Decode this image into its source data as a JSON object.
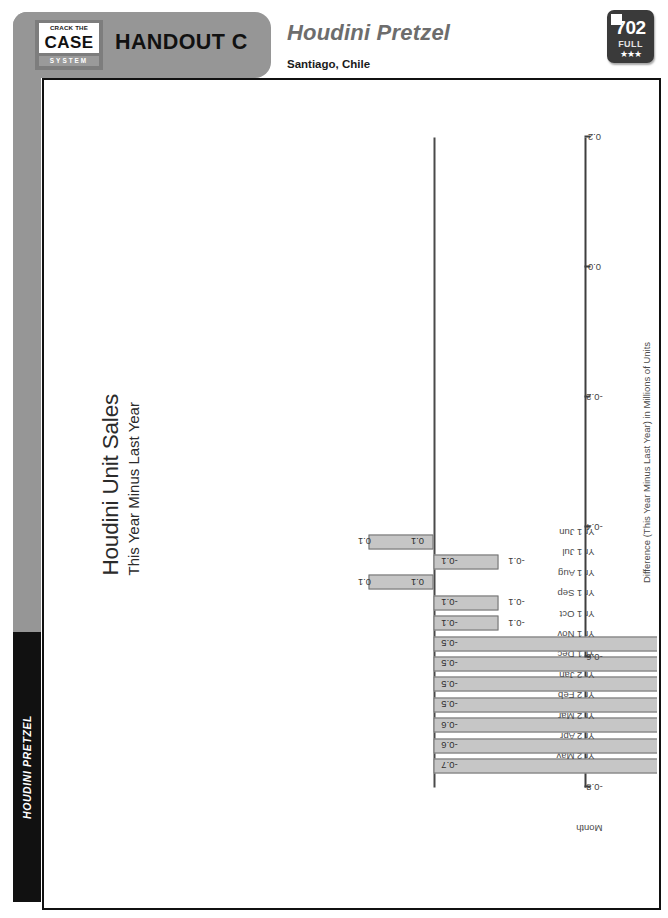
{
  "header": {
    "logo": {
      "crack_the": "CRACK THE",
      "case": "CASE",
      "system": "SYSTEM"
    },
    "handout_label": "HANDOUT C",
    "case_title": "Houdini Pretzel",
    "case_location": "Santiago, Chile",
    "badge": {
      "number": "702",
      "tier": "FULL",
      "stars": "★★★"
    }
  },
  "spine": {
    "label": "HOUDINI PRETZEL"
  },
  "chart_data": {
    "type": "bar",
    "orientation": "horizontal",
    "title": "Houdini Unit Sales",
    "subtitle": "This Year Minus Last Year",
    "xlabel": "Month",
    "ylabel": "Difference (This Year Minus Last Year) in Millions of Units",
    "categories": [
      "Yr 2 May",
      "Yr 2 Apr",
      "Yr 2 Mar",
      "Yr 2 Feb",
      "Yr 2 Jan",
      "Yr 1 Dec",
      "Yr 1 Nov",
      "Yr 1 Oct",
      "Yr 1 Sep",
      "Yr 1 Aug",
      "Yr 1 Jul",
      "Yr 1 Jun"
    ],
    "values": [
      -0.7,
      -0.6,
      -0.6,
      -0.5,
      -0.5,
      -0.5,
      -0.5,
      -0.1,
      -0.1,
      0.1,
      -0.1,
      0.1
    ],
    "value_labels": [
      "-0.7",
      "-0.6",
      "-0.6",
      "-0.5",
      "-0.5",
      "-0.5",
      "-0.5",
      "-0.1",
      "-0.1",
      "0.1",
      "-0.1",
      "0.1"
    ],
    "ticks": [
      "-0.8",
      "-0.6",
      "-0.4",
      "-0.2",
      "0.0",
      "0.2"
    ],
    "tick_values": [
      -0.8,
      -0.6,
      -0.4,
      -0.2,
      0.0,
      0.2
    ],
    "ylim": [
      -0.8,
      0.2
    ],
    "grid": false,
    "legend": "none",
    "bar_fill": "#c6c6c6",
    "bar_stroke": "#6f6f6f"
  }
}
